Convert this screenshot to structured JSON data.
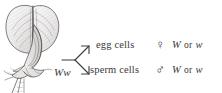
{
  "figure": {
    "background_color": "#ffffff",
    "ink_color": "#3a3a3a"
  },
  "illustration": {
    "name": "pea-flower-drawing",
    "subject": "pea flower",
    "style": "pen and ink botanical sketch"
  },
  "parent": {
    "genotype": "Ww"
  },
  "arrow": {
    "name": "branching-arrow",
    "branches": 2
  },
  "gametes": [
    {
      "cell_type": "egg cells",
      "sex_symbol": "♀",
      "sex_symbol_name": "venus-female-icon",
      "allele_first": "W",
      "conjunction": "or",
      "allele_second": "w"
    },
    {
      "cell_type": "sperm cells",
      "sex_symbol": "♂",
      "sex_symbol_name": "mars-male-icon",
      "allele_first": "W",
      "conjunction": "or",
      "allele_second": "w"
    }
  ]
}
